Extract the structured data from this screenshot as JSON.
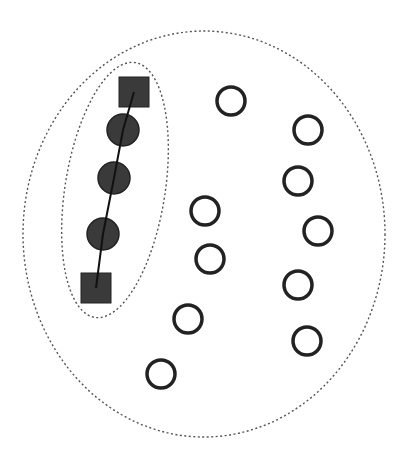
{
  "diagram": {
    "width": 406,
    "height": 467,
    "colors": {
      "background": "#ffffff",
      "boundary": "#555555",
      "filled_node": "#3a3a3a",
      "node_stroke": "#222222",
      "open_node_fill": "#ffffff",
      "path_line": "#111111"
    },
    "outer_group": {
      "shape": "dashed-ellipse",
      "cx": 204,
      "cy": 234,
      "rx": 181,
      "ry": 203
    },
    "inner_group": {
      "shape": "dashed-ellipse",
      "cx": 115,
      "cy": 190,
      "rx": 50,
      "ry": 129,
      "rotation": 9
    },
    "path_nodes": [
      {
        "type": "square",
        "x": 134,
        "y": 92,
        "size": 30
      },
      {
        "type": "circle",
        "x": 123,
        "y": 130,
        "r": 16
      },
      {
        "type": "circle",
        "x": 114,
        "y": 178,
        "r": 16
      },
      {
        "type": "circle",
        "x": 103,
        "y": 234,
        "r": 16
      },
      {
        "type": "square",
        "x": 96,
        "y": 288,
        "size": 30
      }
    ],
    "open_nodes": [
      {
        "x": 231,
        "y": 101,
        "r": 14
      },
      {
        "x": 308,
        "y": 130,
        "r": 14
      },
      {
        "x": 298,
        "y": 181,
        "r": 14
      },
      {
        "x": 205,
        "y": 211,
        "r": 14
      },
      {
        "x": 318,
        "y": 231,
        "r": 14
      },
      {
        "x": 210,
        "y": 259,
        "r": 14
      },
      {
        "x": 298,
        "y": 285,
        "r": 14
      },
      {
        "x": 188,
        "y": 319,
        "r": 14
      },
      {
        "x": 307,
        "y": 341,
        "r": 14
      },
      {
        "x": 161,
        "y": 374,
        "r": 14
      }
    ]
  }
}
